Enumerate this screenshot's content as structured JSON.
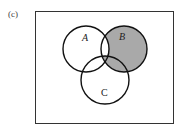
{
  "figure": {
    "panel_label": "(c)",
    "sets": [
      {
        "name": "A"
      },
      {
        "name": "B"
      },
      {
        "name": "C"
      }
    ],
    "shaded_region": "B minus (A ∩ B ∩ C')",
    "colors": {
      "shade": "#a9a9a9",
      "stroke": "#111111",
      "frame": "#333333"
    }
  }
}
